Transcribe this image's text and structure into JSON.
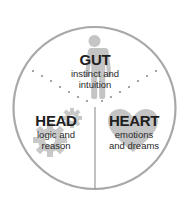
{
  "diagram": {
    "type": "circle-three-sections",
    "colors": {
      "circle_stroke": "#a8a8a8",
      "icon_fill": "#c4c4c4",
      "divider": "#999999",
      "dots": "#7a7a7a",
      "text": "#1e1e1e"
    },
    "sections": [
      {
        "id": "gut",
        "title": "GUT",
        "line1": "instinct and",
        "line2": "intuition",
        "icon": "human-figure-icon"
      },
      {
        "id": "head",
        "title": "HEAD",
        "line1": "logic and",
        "line2": "reason",
        "icon": "gear-icon"
      },
      {
        "id": "heart",
        "title": "HEART",
        "line1": "emotions",
        "line2": "and dreams",
        "icon": "heart-icon"
      }
    ]
  }
}
